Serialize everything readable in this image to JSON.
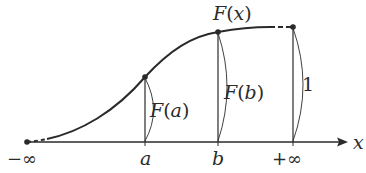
{
  "diagram": {
    "type": "cumulative-distribution-function",
    "curve_label": "F(x)",
    "curve_label_parts": {
      "fn": "F",
      "open": "(",
      "arg": "x",
      "close": ")"
    },
    "axis": {
      "label": "x",
      "ticks": [
        {
          "id": "neg-inf",
          "label": "−∞"
        },
        {
          "id": "a",
          "label": "a"
        },
        {
          "id": "b",
          "label": "b"
        },
        {
          "id": "pos-inf",
          "label": "+∞"
        }
      ]
    },
    "heights": [
      {
        "id": "F-a",
        "fn": "F",
        "open": "(",
        "arg": "a",
        "close": ")",
        "text": "F(a)"
      },
      {
        "id": "F-b",
        "fn": "F",
        "open": "(",
        "arg": "b",
        "close": ")",
        "text": "F(b)"
      },
      {
        "id": "one",
        "text": "1"
      }
    ]
  },
  "colors": {
    "ink": "#2a2a2a",
    "background": "#ffffff"
  }
}
